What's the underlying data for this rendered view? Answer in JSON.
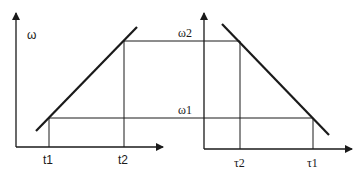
{
  "diagram": {
    "left_plot": {
      "y_axis_label": "ω",
      "x_ticks": [
        "t1",
        "t2"
      ]
    },
    "right_plot": {
      "y_ticks": [
        "ω2",
        "ω1"
      ],
      "x_ticks": [
        "τ2",
        "τ1"
      ]
    },
    "colors": {
      "line": "#1a1a1a",
      "background": "#ffffff"
    }
  }
}
